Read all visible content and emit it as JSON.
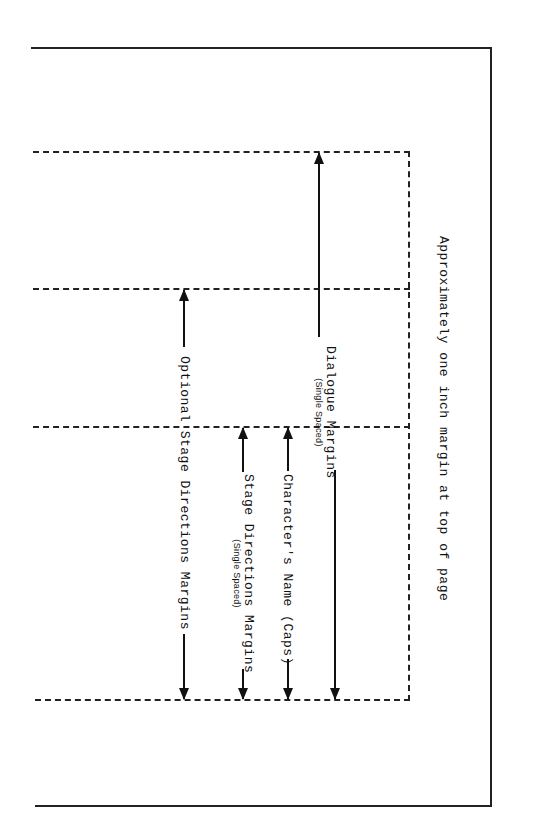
{
  "diagram": {
    "top_margin_note": "Approximately one inch margin at top of page",
    "labels": {
      "dialogue": {
        "main": "Dialogue Margins",
        "sub": "(Single Spaced)"
      },
      "optional_stage": {
        "main": "Optional Stage Directions Margins"
      },
      "stage_directions": {
        "main": "Stage Directions Margins",
        "sub": "(Single Spaced)"
      },
      "character_name": {
        "main": "Character's Name (Caps)"
      }
    },
    "colors": {
      "line": "#222222",
      "background": "#ffffff"
    }
  }
}
